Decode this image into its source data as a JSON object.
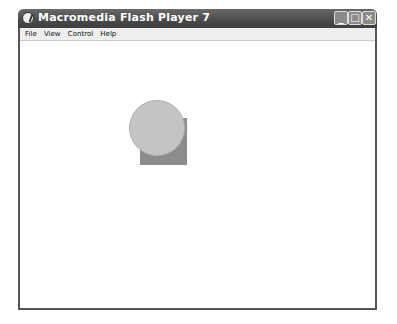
{
  "window": {
    "title": "Macromedia Flash Player 7",
    "controls": {
      "minimize": "_",
      "maximize": "□",
      "close": "✕"
    }
  },
  "menu": {
    "items": [
      "File",
      "View",
      "Control",
      "Help"
    ]
  },
  "stage": {
    "shapes": [
      {
        "type": "square",
        "color": "#8c8c8c"
      },
      {
        "type": "circle",
        "color": "#c4c4c4"
      }
    ]
  }
}
